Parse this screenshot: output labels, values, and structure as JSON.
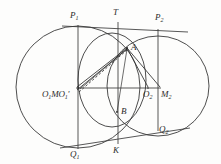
{
  "figure": {
    "kind": "euclidean-geometry-diagram",
    "stroke_color": "#3a3a3a",
    "background_color": "#fdfdfc",
    "label_color": "#2b2b2b"
  },
  "labels": {
    "p1": "P",
    "p1_sub": "1",
    "t": "T",
    "p2": "P",
    "p2_sub": "2",
    "a": "A",
    "b": "B",
    "center_cluster_main": "O",
    "center_cluster_main_sub": "1",
    "center_cluster_mid": "M",
    "center_cluster_prime": "O",
    "center_cluster_prime_sub": "1",
    "center_cluster_prime_mark": "'",
    "o2": "O",
    "o2_sub": "2",
    "m2": "M",
    "m2_sub": "2",
    "q1": "Q",
    "q1_sub": "1",
    "k": "K",
    "q2": "Q",
    "q2_sub": "2"
  },
  "points": {
    "P1": {
      "x": 78,
      "y": 25
    },
    "T": {
      "x": 118,
      "y": 22
    },
    "P2": {
      "x": 158,
      "y": 30
    },
    "A": {
      "x": 127,
      "y": 48
    },
    "B": {
      "x": 117,
      "y": 112
    },
    "O1": {
      "x": 78,
      "y": 88
    },
    "M": {
      "x": 84,
      "y": 88
    },
    "O1p": {
      "x": 90,
      "y": 88
    },
    "O2": {
      "x": 148,
      "y": 88
    },
    "M2": {
      "x": 160,
      "y": 88
    },
    "Q1": {
      "x": 78,
      "y": 148
    },
    "K": {
      "x": 118,
      "y": 143
    },
    "Q2": {
      "x": 158,
      "y": 130
    }
  },
  "circles": [
    {
      "name": "left-large-circle",
      "cx": 78,
      "cy": 87,
      "r": 62
    },
    {
      "name": "right-large-circle",
      "cx": 158,
      "cy": 86,
      "r": 51
    },
    {
      "name": "middle-circle",
      "cx": 113,
      "cy": 80,
      "r": 34
    }
  ],
  "segments": [
    {
      "name": "top-tangent-line",
      "from": "P1",
      "to": "P2"
    },
    {
      "name": "bottom-tangent-line",
      "from": "Q1",
      "to": "Q2"
    },
    {
      "name": "vertical-diameter-left",
      "from": "P1",
      "to": "Q1"
    },
    {
      "name": "vertical-chord-middle",
      "from": "T",
      "to": "K"
    },
    {
      "name": "vertical-diameter-right",
      "from": "P2",
      "to": "Q2"
    },
    {
      "name": "center-horizontal-line",
      "from": "O1",
      "to": "M2"
    },
    {
      "name": "segment-o1-to-a",
      "from": "O1",
      "to": "A"
    },
    {
      "name": "segment-m-to-a",
      "from": "M",
      "to": "A"
    },
    {
      "name": "segment-o1prime-to-a-dashed",
      "from": "O1p",
      "to": "A",
      "style": "dashed"
    },
    {
      "name": "segment-a-to-o2",
      "from": "A",
      "to": "O2"
    },
    {
      "name": "segment-a-to-m2",
      "from": "A",
      "to": "M2"
    }
  ]
}
